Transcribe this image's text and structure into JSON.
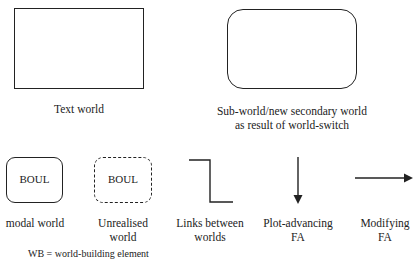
{
  "legend": {
    "text_world": {
      "label": "Text world"
    },
    "sub_world": {
      "label_line1": "Sub-world/new secondary world",
      "label_line2": "as result of world-switch"
    },
    "modal_world": {
      "inner_text": "BOUL",
      "label": "modal world"
    },
    "unrealised_world": {
      "inner_text": "BOUL",
      "label_line1": "Unrealised",
      "label_line2": "world"
    },
    "links": {
      "label_line1": "Links between",
      "label_line2": "worlds"
    },
    "plot_advancing": {
      "label_line1": "Plot-advancing",
      "label_line2": "FA"
    },
    "modifying": {
      "label_line1": "Modifying",
      "label_line2": "FA"
    },
    "footer": {
      "text": "WB = world-building element"
    }
  },
  "colors": {
    "stroke": "#222222",
    "background": "#ffffff"
  }
}
